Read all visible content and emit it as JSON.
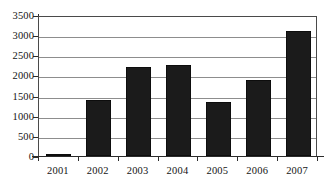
{
  "chart_data": {
    "type": "bar",
    "title": "",
    "subtitle": "",
    "xlabel": "",
    "ylabel": "",
    "categories": [
      "2001",
      "2002",
      "2003",
      "2004",
      "2005",
      "2006",
      "2007"
    ],
    "values": [
      60,
      1400,
      2220,
      2250,
      1330,
      1880,
      3100
    ],
    "series": [
      {
        "name": "",
        "values": [
          60,
          1400,
          2220,
          2250,
          1330,
          1880,
          3100
        ]
      }
    ],
    "ylim": [
      0,
      3500
    ],
    "ytick_labels": [
      "0",
      "500",
      "1000",
      "1500",
      "2000",
      "2500",
      "3000",
      "3500"
    ],
    "ytick_values": [
      0,
      500,
      1000,
      1500,
      2000,
      2500,
      3000,
      3500
    ],
    "grid": true,
    "legend": false,
    "legend_position": "none",
    "bar_color": "#1b1b1b",
    "gridline_color": "#8d8d8d",
    "axis_color": "#2b2b2b",
    "background_color": "#ffffff"
  }
}
